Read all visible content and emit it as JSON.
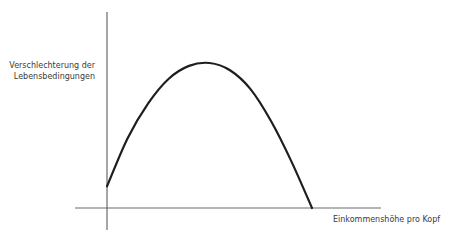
{
  "chart_data": {
    "type": "line",
    "title": "",
    "xlabel": "Einkommenshöhe pro Kopf",
    "ylabel_lines": [
      "Verschlechterung der",
      "Lebensbedingungen"
    ],
    "ylabel": "Verschlechterung der Lebensbedingungen",
    "xlim": [
      0,
      1
    ],
    "ylim": [
      0,
      1
    ],
    "grid": false,
    "legend": "none",
    "ticks": "none",
    "series": [
      {
        "name": "Verlauf",
        "shape": "inverted-u",
        "color": "#1e1e1e",
        "x": [
          0,
          0.1,
          0.2,
          0.3,
          0.4,
          0.5,
          0.6,
          0.7,
          0.8,
          0.9,
          1.0
        ],
        "y": [
          0.15,
          0.48,
          0.72,
          0.89,
          0.98,
          1.0,
          0.95,
          0.82,
          0.6,
          0.32,
          0.0
        ]
      }
    ],
    "annotations": []
  }
}
